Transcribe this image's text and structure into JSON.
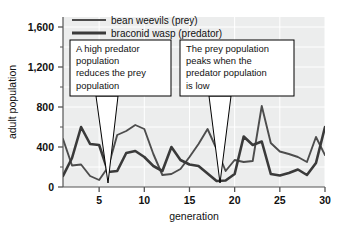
{
  "chart_data": {
    "type": "line",
    "title": "",
    "xlabel": "generation",
    "ylabel": "adult population",
    "xlim": [
      1,
      30
    ],
    "ylim": [
      0,
      1700
    ],
    "xticks": [
      "5",
      "10",
      "15",
      "20",
      "25",
      "30"
    ],
    "xtick_values": [
      5,
      10,
      15,
      20,
      25,
      30
    ],
    "yticks": [
      "0",
      "400",
      "800",
      "1,200",
      "1,600"
    ],
    "ytick_values": [
      0,
      400,
      800,
      1200,
      1600
    ],
    "y_minor_step": 200,
    "grid": true,
    "legend_position": "top-left-inside",
    "series": [
      {
        "name": "bean weevils (prey)",
        "color": "#4d4d4d",
        "x": [
          1,
          2,
          3,
          4,
          5,
          6,
          7,
          8,
          9,
          10,
          11,
          12,
          13,
          14,
          15,
          16,
          17,
          18,
          19,
          20,
          21,
          22,
          23,
          24,
          25,
          26,
          27,
          28,
          29,
          30
        ],
        "values": [
          480,
          215,
          225,
          110,
          70,
          200,
          520,
          560,
          620,
          580,
          330,
          120,
          130,
          180,
          300,
          430,
          580,
          380,
          160,
          270,
          250,
          260,
          810,
          440,
          355,
          330,
          300,
          250,
          500,
          320
        ]
      },
      {
        "name": "braconid wasp (predator)",
        "color": "#3a3a3a",
        "x": [
          1,
          2,
          3,
          4,
          5,
          6,
          7,
          8,
          9,
          10,
          11,
          12,
          13,
          14,
          15,
          16,
          17,
          18,
          19,
          20,
          21,
          22,
          23,
          24,
          25,
          26,
          27,
          28,
          29,
          30
        ],
        "values": [
          110,
          290,
          600,
          430,
          420,
          150,
          160,
          340,
          360,
          300,
          210,
          160,
          400,
          270,
          225,
          210,
          135,
          60,
          65,
          130,
          505,
          420,
          455,
          130,
          115,
          140,
          175,
          120,
          240,
          600
        ]
      }
    ],
    "annotations": [
      {
        "id": "callout-predator-reduces-prey",
        "lines": [
          "A high predator",
          "population",
          "reduces the prey",
          "population"
        ],
        "box": {
          "x": 70,
          "y": 40,
          "w": 101,
          "h": 56
        },
        "pointer": {
          "tip_x": 108,
          "tip_y": 183,
          "base_left_x": 96,
          "base_right_x": 118
        }
      },
      {
        "id": "callout-prey-peaks-when-predator-low",
        "lines": [
          "The prey population",
          "peaks when the",
          "predator population",
          "is low"
        ],
        "box": {
          "x": 180,
          "y": 40,
          "w": 114,
          "h": 56
        },
        "pointer": {
          "tip_x": 220,
          "tip_y": 183,
          "base_left_x": 209,
          "base_right_x": 231
        }
      }
    ]
  },
  "colors": {
    "plot_background": "#eceded",
    "gridline": "#ffffff",
    "axis": "#555555",
    "text": "#111111",
    "callout_border": "#000000",
    "callout_fill": "#ffffff",
    "prey_line": "#4d4d4d",
    "predator_line": "#3a3a3a"
  },
  "legend": {
    "entries": [
      {
        "label": "bean weevils (prey)",
        "color": "#4d4d4d",
        "width": 1.8
      },
      {
        "label": "braconid wasp (predator)",
        "color": "#3a3a3a",
        "width": 3.0
      }
    ]
  }
}
